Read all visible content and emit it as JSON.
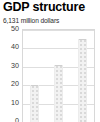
{
  "chart": {
    "title": "GDP structure",
    "subtitle": "6,131 million dollars"
  },
  "chart_data": {
    "type": "bar",
    "title": "GDP structure",
    "subtitle": "6,131 million dollars",
    "xlabel": "",
    "ylabel": "",
    "categories": [
      "1",
      "2",
      "3"
    ],
    "values": [
      20,
      31,
      45
    ],
    "ylim": [
      0,
      50
    ],
    "yticks": [
      50,
      40,
      30,
      20,
      10,
      0
    ],
    "ytick_labels": [
      "50",
      "40",
      "30",
      "20",
      "10",
      "0"
    ],
    "grid": true,
    "legend": "none",
    "series": [
      {
        "name": "share",
        "values": [
          20,
          31,
          45
        ]
      }
    ],
    "note": "bottom of plot is cropped by the screenshot edge; bars use a light dotted texture fill"
  }
}
